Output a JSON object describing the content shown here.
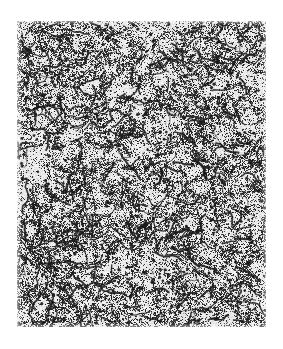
{
  "figure": {
    "kind": "micrograph",
    "caption": "",
    "label": "",
    "scale_bar_text": "",
    "magnification_text": ""
  },
  "canvas": {
    "page_width": 283,
    "page_height": 349,
    "background_color": "#ffffff",
    "plate_left": 17,
    "plate_top": 21,
    "plate_width": 249,
    "plate_height": 306
  },
  "appearance": {
    "paper_color": "#ffffff",
    "plate_base_color": "#f2f2f0",
    "grain_light_color": "#e8e8e6",
    "grain_dark_color": "#1a1a1a",
    "mid_tone_color": "#6e6e6e",
    "speckle_density": 0.46,
    "boundary_network_strength": 0.62,
    "noise_seed": 20240517
  }
}
